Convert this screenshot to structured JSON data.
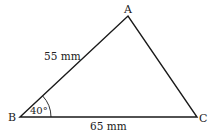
{
  "diagram": {
    "type": "triangle",
    "vertices": {
      "A": {
        "label": "A"
      },
      "B": {
        "label": "B"
      },
      "C": {
        "label": "C"
      }
    },
    "sides": {
      "AB": {
        "label": "55 mm"
      },
      "BC": {
        "label": "65 mm"
      }
    },
    "angles": {
      "B": {
        "label": "40°"
      }
    },
    "colors": {
      "stroke": "#1a1a1a",
      "text": "#222222",
      "background": "#ffffff"
    }
  }
}
